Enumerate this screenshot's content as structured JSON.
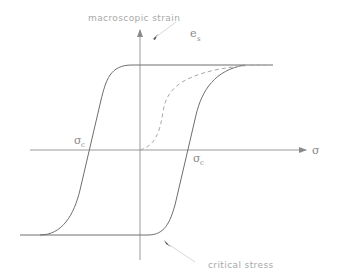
{
  "diagram": {
    "type": "hysteresis-loop",
    "y_axis_label": "macroscopic strain",
    "saturation_label": {
      "symbol": "e",
      "subscript": "s"
    },
    "x_axis_label": "σ",
    "critical_stress_left": {
      "symbol": "σ",
      "subscript": "c"
    },
    "critical_stress_right": {
      "symbol": "σ",
      "subscript": "c"
    },
    "annotation_bottom": "critical stress",
    "curves": [
      {
        "name": "hysteresis-loop",
        "style": "solid"
      },
      {
        "name": "virgin-curve",
        "style": "dashed"
      }
    ]
  }
}
